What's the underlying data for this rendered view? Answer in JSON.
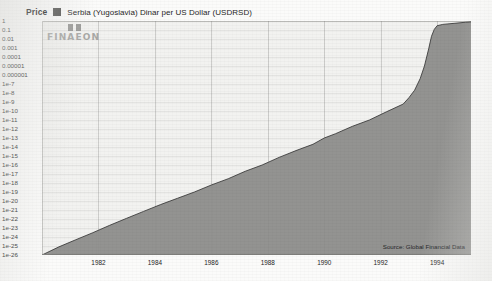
{
  "legend": {
    "price_label": "Price",
    "series_label": "Serbia (Yugoslavia) Dinar per US Dollar (USDRSD)",
    "swatch_color": "#555553"
  },
  "watermark": {
    "text": "FINAEON"
  },
  "source": {
    "text": "Source: Global Financial Data"
  },
  "chart_data": {
    "type": "area",
    "title": "",
    "subtitle": "",
    "xlabel": "",
    "ylabel": "Price",
    "legend_position": "top-left",
    "grid": true,
    "yscale": "log",
    "ylim": [
      1e-26,
      1
    ],
    "xlim": [
      1980.0,
      1995.2
    ],
    "series": [
      {
        "name": "Serbia (Yugoslavia) Dinar per US Dollar (USDRSD)",
        "color": "#8d8d8b",
        "x": [
          1980.0,
          1980.6,
          1981.2,
          1981.8,
          1982.4,
          1983.0,
          1983.6,
          1984.2,
          1984.8,
          1985.4,
          1986.0,
          1986.6,
          1987.2,
          1987.8,
          1988.4,
          1989.0,
          1989.6,
          1990.0,
          1990.4,
          1991.0,
          1991.6,
          1992.2,
          1992.8,
          1993.0,
          1993.2,
          1993.4,
          1993.55,
          1993.7,
          1993.8,
          1993.9,
          1994.0,
          1994.2,
          1994.6,
          1995.0,
          1995.2
        ],
        "y": [
          1e-26,
          8e-26,
          5e-25,
          3e-24,
          2e-23,
          1.2e-22,
          7e-22,
          4e-21,
          2e-20,
          1e-19,
          6e-19,
          3e-18,
          2e-17,
          1e-16,
          7e-16,
          4e-15,
          2e-14,
          1e-13,
          3e-13,
          2e-12,
          1e-11,
          8e-11,
          6e-10,
          3e-09,
          2e-08,
          4e-07,
          1e-05,
          0.0008,
          0.02,
          0.12,
          0.3,
          0.42,
          0.55,
          0.72,
          0.8
        ]
      }
    ],
    "y_tick_labels": [
      "1",
      "0.1",
      "0.01",
      "0.001",
      "0.0001",
      "0.00001",
      "0.000001",
      "1e-7",
      "1e-8",
      "1e-9",
      "1e-10",
      "1e-11",
      "1e-12",
      "1e-13",
      "1e-14",
      "1e-15",
      "1e-16",
      "1e-17",
      "1e-18",
      "1e-19",
      "1e-20",
      "1e-21",
      "1e-22",
      "1e-23",
      "1e-24",
      "1e-25",
      "1e-26"
    ],
    "y_tick_values": [
      1,
      0.1,
      0.01,
      0.001,
      0.0001,
      1e-05,
      1e-06,
      1e-07,
      1e-08,
      1e-09,
      1e-10,
      1e-11,
      1e-12,
      1e-13,
      1e-14,
      1e-15,
      1e-16,
      1e-17,
      1e-18,
      1e-19,
      1e-20,
      1e-21,
      1e-22,
      1e-23,
      1e-24,
      1e-25,
      1e-26
    ],
    "x_tick_labels": [
      "1982",
      "1984",
      "1986",
      "1988",
      "1990",
      "1992",
      "1994"
    ],
    "x_tick_values": [
      1982,
      1984,
      1986,
      1988,
      1990,
      1992,
      1994
    ]
  }
}
